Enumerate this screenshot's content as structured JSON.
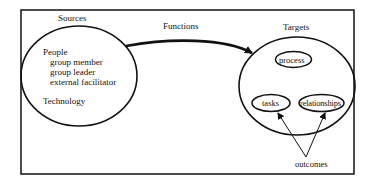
{
  "diagram": {
    "sources": {
      "title": "Sources",
      "people_label": "People",
      "people_items": [
        "group member",
        "group leader",
        "external facilitator"
      ],
      "technology_label": "Technology"
    },
    "functions_label": "Functions",
    "targets": {
      "title": "Targets",
      "items": [
        "process",
        "tasks",
        "relationships"
      ]
    },
    "outcomes_label": "outcomes",
    "colors": {
      "stroke": "#111111",
      "background": "#ffffff"
    }
  }
}
